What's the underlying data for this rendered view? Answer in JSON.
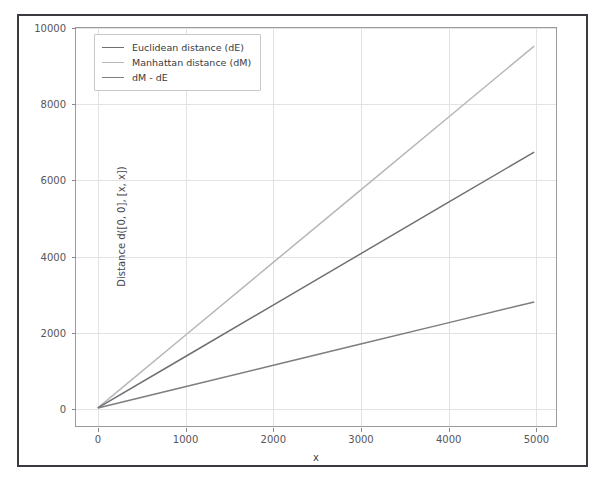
{
  "figure": {
    "background": "#ffffff",
    "border_color": "#3a3a40"
  },
  "chart_data": {
    "type": "line",
    "title": "",
    "xlabel": "x",
    "ylabel": "Distance d([0, 0], [x, x])",
    "xlim": [
      -250,
      5250
    ],
    "ylim": [
      -500,
      10500
    ],
    "xticks": [
      0,
      1000,
      2000,
      3000,
      4000,
      5000
    ],
    "xticklabels": [
      "0",
      "1000",
      "2000",
      "3000",
      "4000",
      "5000"
    ],
    "yticks": [
      0,
      2000,
      4000,
      6000,
      8000,
      10000
    ],
    "yticklabels": [
      "0",
      "2000",
      "4000",
      "6000",
      "8000",
      "10000"
    ],
    "grid": true,
    "grid_color": "#e3e3e6",
    "legend_position": "upper left",
    "x": [
      0,
      1000,
      2000,
      3000,
      4000,
      5000
    ],
    "series": [
      {
        "name": "Euclidean distance (dE)",
        "color": "#6f6f74",
        "linewidth": 1.5,
        "values": [
          0,
          1414,
          2828,
          4243,
          5657,
          7071
        ]
      },
      {
        "name": "Manhattan distance (dM)",
        "color": "#b6b6ba",
        "linewidth": 1.5,
        "values": [
          0,
          2000,
          4000,
          6000,
          8000,
          10000
        ]
      },
      {
        "name": "dM - dE",
        "color": "#7d7d82",
        "linewidth": 1.5,
        "values": [
          0,
          586,
          1172,
          1757,
          2343,
          2929
        ]
      }
    ]
  }
}
